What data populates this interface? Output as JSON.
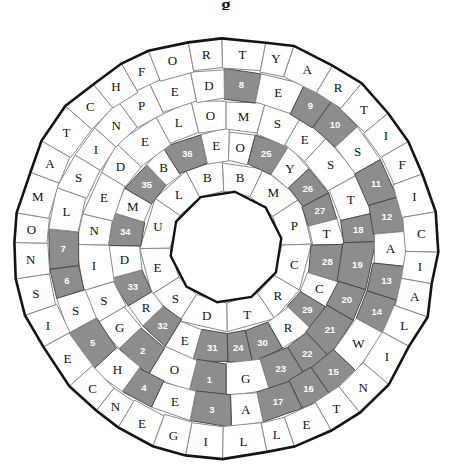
{
  "title": "g",
  "puzzle": {
    "name": "circular-word-wheel-puzzle",
    "center_x": 226,
    "center_y": 247,
    "hole_radius": 56,
    "ring_radii": [
      56,
      86,
      117,
      148,
      179,
      211
    ],
    "sides": 36,
    "colors": {
      "cell_fill": "#ffffff",
      "cell_stroke": "#8a8a8a",
      "shaded_fill": "#8d8d8d",
      "shaded_stroke": "#4a4a4a",
      "rim_stroke": "#141414",
      "letter_color": "#111111",
      "number_color": "#ffffff"
    },
    "rings": [
      {
        "index": 1,
        "name": "ring-1-inner",
        "count": 12,
        "start_angle": -90,
        "letters": [
          "B",
          "M",
          "P",
          "C",
          "R",
          "T",
          "D",
          "S",
          "E",
          "U",
          "L",
          "B"
        ],
        "shaded": []
      },
      {
        "index": 2,
        "name": "ring-2",
        "count": 18,
        "start_angle": -90,
        "letters": [
          "O",
          "N",
          "Y",
          "O",
          "H",
          "A",
          "L",
          "O",
          "E",
          "E",
          "T",
          "O",
          "L",
          "G",
          "R",
          "D",
          "L",
          "D"
        ],
        "shaded": []
      },
      {
        "index": 3,
        "name": "ring-3",
        "count": 24,
        "start_angle": -90,
        "letters": [
          "M",
          "E",
          "E",
          "D",
          "T",
          "S",
          "T",
          "A",
          "P",
          "I",
          "R",
          "O",
          "S",
          "E",
          "R",
          "G",
          "X",
          "O",
          "L",
          "S",
          "G",
          "S",
          "I",
          "U"
        ],
        "shaded": []
      },
      {
        "index": 4,
        "name": "ring-4",
        "count": 30,
        "start_angle": -90,
        "letters": [
          "S",
          "S",
          "E",
          "S",
          "I",
          "C",
          "T",
          "P",
          "A",
          "W",
          "E",
          "H",
          "E",
          "A",
          "F",
          "T",
          "E",
          "R",
          "E",
          "H",
          "E",
          "S",
          "T",
          "L",
          "I",
          "S",
          "N",
          "P",
          "E",
          "D"
        ],
        "shaded": []
      },
      {
        "index": 5,
        "name": "ring-5-outer",
        "count": 36,
        "start_angle": -90,
        "letters": [
          "A",
          "R",
          "T",
          "I",
          "F",
          "I",
          "C",
          "I",
          "A",
          "L",
          "I",
          "N",
          "T",
          "E",
          "L",
          "L",
          "I",
          "G",
          "E",
          "N",
          "C",
          "E",
          "I",
          "S",
          "N",
          "O",
          "M",
          "A",
          "T",
          "C",
          "H",
          "F",
          "O",
          "R",
          "H",
          "U"
        ],
        "shaded": []
      }
    ],
    "numbered_cells": [
      {
        "n": 1,
        "ring": 3,
        "slot": 1,
        "angle": -82
      },
      {
        "n": 2,
        "ring": 3,
        "slot": 3,
        "angle": -52
      },
      {
        "n": 3,
        "ring": 4,
        "slot": 3,
        "angle": -34
      },
      {
        "n": 4,
        "ring": 4,
        "slot": 5,
        "angle": -10
      },
      {
        "n": 5,
        "ring": 4,
        "slot": 7,
        "angle": 14
      },
      {
        "n": 6,
        "ring": 4,
        "slot": 9,
        "angle": 38
      },
      {
        "n": 7,
        "ring": 4,
        "slot": 11,
        "angle": 56
      },
      {
        "n": 8,
        "ring": 4,
        "slot": 13,
        "angle": 78
      },
      {
        "n": 9,
        "ring": 4,
        "slot": 15,
        "angle": 100
      },
      {
        "n": 10,
        "ring": 4,
        "slot": 17,
        "angle": 118
      },
      {
        "n": 11,
        "ring": 4,
        "slot": 19,
        "angle": 136
      },
      {
        "n": 12,
        "ring": 4,
        "slot": 21,
        "angle": 160
      },
      {
        "n": 13,
        "ring": 4,
        "slot": 23,
        "angle": 184
      },
      {
        "n": 14,
        "ring": 4,
        "slot": 25,
        "angle": 206
      },
      {
        "n": 15,
        "ring": 4,
        "slot": 27,
        "angle": 224
      },
      {
        "n": 16,
        "ring": 4,
        "slot": 29,
        "angle": 242
      },
      {
        "n": 17,
        "ring": 4,
        "slot": 31,
        "angle": 260
      },
      {
        "n": 18,
        "ring": 3,
        "slot": 15,
        "angle": 278
      },
      {
        "n": 19,
        "ring": 3,
        "slot": 17,
        "angle": 296
      },
      {
        "n": 20,
        "ring": 3,
        "slot": 19,
        "angle": 314
      },
      {
        "n": 21,
        "ring": 3,
        "slot": 21,
        "angle": 332
      },
      {
        "n": 22,
        "ring": 3,
        "slot": 23,
        "angle": 350
      },
      {
        "n": 23,
        "ring": 3,
        "slot": 1,
        "angle": 8
      },
      {
        "n": 24,
        "ring": 2,
        "slot": 1,
        "angle": 26
      },
      {
        "n": 25,
        "ring": 2,
        "slot": 3,
        "angle": 44
      },
      {
        "n": 26,
        "ring": 2,
        "slot": 5,
        "angle": 62
      },
      {
        "n": 27,
        "ring": 2,
        "slot": 7,
        "angle": 80
      },
      {
        "n": 28,
        "ring": 2,
        "slot": 9,
        "angle": 98
      },
      {
        "n": 29,
        "ring": 2,
        "slot": 11,
        "angle": 116
      },
      {
        "n": 30,
        "ring": 2,
        "slot": 13,
        "angle": 134
      },
      {
        "n": 31,
        "ring": 2,
        "slot": 15,
        "angle": 152
      },
      {
        "n": 32,
        "ring": 2,
        "slot": 17,
        "angle": 170
      },
      {
        "n": 33,
        "ring": 2,
        "slot": 19,
        "angle": 188
      },
      {
        "n": 34,
        "ring": 2,
        "slot": 21,
        "angle": 206
      },
      {
        "n": 35,
        "ring": 2,
        "slot": 23,
        "angle": 224
      },
      {
        "n": 36,
        "ring": 2,
        "slot": 25,
        "angle": 242
      }
    ],
    "layout": [
      {
        "ring": 1,
        "r_in": 56,
        "r_out": 88,
        "cells": [
          {
            "a": 270,
            "t": "B"
          },
          {
            "a": 300,
            "t": "M"
          },
          {
            "a": 330,
            "t": "P"
          },
          {
            "a": 0,
            "t": "C"
          },
          {
            "a": 30,
            "t": "R"
          },
          {
            "a": 60,
            "t": "T"
          },
          {
            "a": 90,
            "t": "D"
          },
          {
            "a": 120,
            "t": "S"
          },
          {
            "a": 150,
            "t": "E"
          },
          {
            "a": 180,
            "t": "U"
          },
          {
            "a": 210,
            "t": "L"
          },
          {
            "a": 240,
            "t": "B"
          }
        ]
      },
      {
        "ring": 2,
        "r_in": 88,
        "r_out": 120,
        "cells": [
          {
            "a": 270,
            "t": "O",
            "s": false
          },
          {
            "a": 292,
            "t": "Y",
            "s": false
          },
          {
            "a": 314,
            "t": "O",
            "s": false
          },
          {
            "a": 336,
            "t": "H",
            "s": false
          },
          {
            "a": 358,
            "t": "A",
            "s": false
          },
          {
            "a": 20,
            "t": "L",
            "s": false
          },
          {
            "a": 42,
            "t": "O",
            "s": false
          },
          {
            "a": 64,
            "t": "R",
            "s": false
          },
          {
            "a": 86,
            "t": "E",
            "s": false
          },
          {
            "a": 108,
            "t": "E",
            "s": false
          },
          {
            "a": 130,
            "t": "E",
            "s": false
          },
          {
            "a": 152,
            "t": "T",
            "s": false
          },
          {
            "a": 174,
            "t": "A",
            "s": false
          },
          {
            "a": 196,
            "t": "O",
            "s": false
          },
          {
            "a": 218,
            "t": "O",
            "s": false
          },
          {
            "a": 240,
            "t": "G",
            "s": false
          },
          {
            "a": 248,
            "t": "D",
            "s": false
          },
          {
            "a": 262,
            "t": "L",
            "s": false
          }
        ]
      }
    ],
    "ring_cell_text": {
      "r1": [
        "B",
        "M",
        "P",
        "C",
        "R",
        "T",
        "D",
        "S",
        "E",
        "U",
        "L",
        "B"
      ],
      "r2": [
        "O",
        "N",
        "Y",
        "O",
        "S",
        "T",
        "H",
        "C",
        "N",
        "R",
        "T",
        "S",
        "D",
        "E",
        "L",
        "R",
        "E",
        "D",
        "U",
        "M",
        "A",
        "B",
        "O",
        "E"
      ],
      "r3": [
        "M",
        "S",
        "E",
        "S",
        "T",
        "A",
        "P",
        "I",
        "O",
        "S",
        "R",
        "G",
        "X",
        "O",
        "L",
        "G",
        "S",
        "I",
        "N",
        "E",
        "D",
        "E",
        "L",
        "O"
      ],
      "r4": [
        "S",
        "E",
        "Y",
        "D",
        "S",
        "I",
        "T",
        "A",
        "L",
        "R",
        "W",
        "E",
        "H",
        "E",
        "A",
        "T",
        "E",
        "R",
        "H",
        "E",
        "S",
        "X",
        "E",
        "L",
        "S",
        "I",
        "N",
        "P",
        "E",
        "D"
      ],
      "r5": [
        "T",
        "Y",
        "A",
        "R",
        "T",
        "I",
        "F",
        "I",
        "C",
        "I",
        "A",
        "L",
        "I",
        "N",
        "T",
        "E",
        "L",
        "L",
        "I",
        "G",
        "E",
        "N",
        "C",
        "E",
        "I",
        "S",
        "N",
        "O",
        "M",
        "A",
        "T",
        "C",
        "H",
        "F",
        "O",
        "R"
      ]
    }
  },
  "rendered_letters": {
    "outer_ring": [
      "T",
      "Y",
      "A",
      "R",
      "T",
      "I",
      "F",
      "I",
      "C",
      "I",
      "A",
      "L",
      "I",
      "N",
      "T",
      "E",
      "L",
      "L",
      "I",
      "G",
      "E",
      "N",
      "C",
      "E",
      "I",
      "S",
      "N",
      "O",
      "M",
      "A",
      "T",
      "C",
      "H",
      "F",
      "O",
      "R",
      "H",
      "U",
      "M",
      "A",
      "N",
      "S",
      "T",
      "U",
      "P",
      "I",
      "D",
      "I"
    ],
    "outer_note": "outer ring reads: ARTIFICIAL INTELLIGENCE IS NO MATCH FOR HUMAN STUPIDITY"
  }
}
